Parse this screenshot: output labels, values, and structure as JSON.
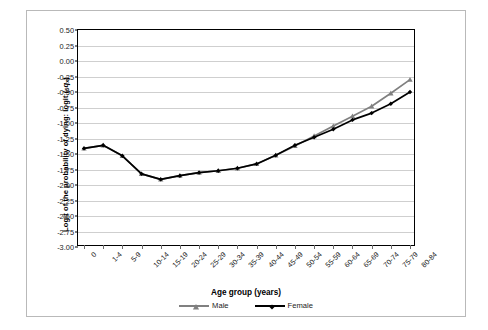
{
  "chart_data": {
    "type": "line",
    "title": "",
    "xlabel": "Age group (years)",
    "ylabel": "Logit of the probability of dying: logit (5qx)",
    "ylim": [
      -3.0,
      0.5
    ],
    "ytick_step": 0.25,
    "grid": true,
    "legend_position": "bottom",
    "categories": [
      "0",
      "1-4",
      "5-9",
      "10-14",
      "15-19",
      "20-24",
      "25-29",
      "30-34",
      "35-39",
      "40-44",
      "45-49",
      "50-54",
      "55-59",
      "60-64",
      "65-69",
      "70-74",
      "75-79",
      "80-84"
    ],
    "ytick_labels": [
      "0.50",
      "0.25",
      "0.00",
      "-0.25",
      "-0.50",
      "-0.75",
      "-1.00",
      "-1.25",
      "-1.50",
      "-1.75",
      "-2.00",
      "-2.25",
      "-2.50",
      "-2.75",
      "-3.00"
    ],
    "ytick_values": [
      0.5,
      0.25,
      0.0,
      -0.25,
      -0.5,
      -0.75,
      -1.0,
      -1.25,
      -1.5,
      -1.75,
      -2.0,
      -2.25,
      -2.5,
      -2.75,
      -3.0
    ],
    "series": [
      {
        "name": "Male",
        "color": "#808080",
        "marker": "triangle",
        "values": [
          -1.41,
          -1.36,
          -1.53,
          -1.82,
          -1.91,
          -1.85,
          -1.8,
          -1.77,
          -1.73,
          -1.66,
          -1.52,
          -1.37,
          -1.21,
          -1.05,
          -0.89,
          -0.73,
          -0.52,
          -0.3
        ]
      },
      {
        "name": "Female",
        "color": "#000000",
        "marker": "diamond",
        "values": [
          -1.41,
          -1.36,
          -1.53,
          -1.82,
          -1.91,
          -1.85,
          -1.8,
          -1.77,
          -1.73,
          -1.66,
          -1.52,
          -1.36,
          -1.23,
          -1.1,
          -0.95,
          -0.84,
          -0.69,
          -0.5
        ]
      }
    ]
  },
  "axis": {
    "y_title_main": "Logit of the probability of dying: logit (",
    "y_title_sub_pre": "5",
    "y_title_var": "q",
    "y_title_sub_post": "x",
    "y_title_close": ")",
    "x_title": "Age group (years)"
  },
  "legend": {
    "items": [
      {
        "label": "Male",
        "color": "#808080",
        "marker": "triangle"
      },
      {
        "label": "Female",
        "color": "#000000",
        "marker": "diamond"
      }
    ]
  }
}
